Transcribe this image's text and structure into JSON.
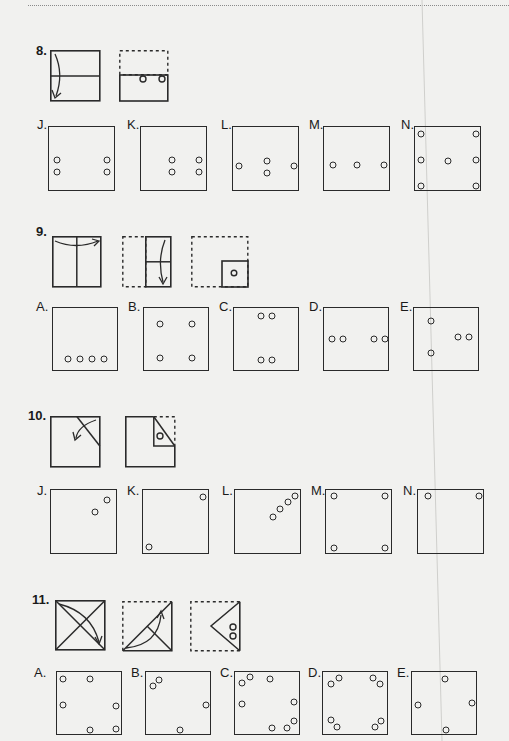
{
  "page": {
    "background": "#f1f1ef",
    "ink": "#2a2a2a"
  },
  "problems": [
    {
      "number": "8.",
      "steps": [
        "fold-top-down",
        "punch-two-holes"
      ],
      "options": [
        {
          "label": "J.",
          "holes": [
            [
              8,
              45
            ],
            [
              8,
              57
            ],
            [
              90,
              45
            ],
            [
              90,
              57
            ]
          ]
        },
        {
          "label": "K.",
          "holes": [
            [
              55,
              45
            ],
            [
              55,
              57
            ],
            [
              90,
              45
            ],
            [
              90,
              57
            ]
          ]
        },
        {
          "label": "L.",
          "holes": [
            [
              12,
              50
            ],
            [
              58,
              45
            ],
            [
              58,
              57
            ],
            [
              103,
              50
            ]
          ]
        },
        {
          "label": "M.",
          "holes": [
            [
              12,
              51
            ],
            [
              51,
              51
            ],
            [
              90,
              51
            ]
          ]
        },
        {
          "label": "N.",
          "holes": [
            [
              8,
              8
            ],
            [
              8,
              51
            ],
            [
              8,
              92
            ],
            [
              51,
              51
            ],
            [
              94,
              8
            ],
            [
              94,
              51
            ],
            [
              94,
              92
            ]
          ]
        }
      ]
    },
    {
      "number": "9.",
      "steps": [
        "fold-left-to-right",
        "fold-top-down",
        "punch-one-hole"
      ],
      "options": [
        {
          "label": "A.",
          "holes": [
            [
              15,
              50
            ],
            [
              27,
              50
            ],
            [
              39,
              50
            ],
            [
              51,
              50
            ]
          ]
        },
        {
          "label": "B.",
          "holes": [
            [
              15,
              15
            ],
            [
              49,
              15
            ],
            [
              15,
              48
            ],
            [
              49,
              48
            ]
          ]
        },
        {
          "label": "C.",
          "holes": [
            [
              28,
              8
            ],
            [
              39,
              8
            ],
            [
              28,
              51
            ],
            [
              39,
              51
            ]
          ]
        },
        {
          "label": "D.",
          "holes": [
            [
              9,
              30
            ],
            [
              20,
              30
            ],
            [
              51,
              30
            ],
            [
              62,
              30
            ]
          ]
        },
        {
          "label": "E.",
          "holes": [
            [
              18,
              12
            ],
            [
              43,
              28
            ],
            [
              54,
              28
            ],
            [
              18,
              44
            ]
          ]
        }
      ]
    },
    {
      "number": "10.",
      "steps": [
        "fold-corner-diagonal",
        "punch-one-hole"
      ],
      "options": [
        {
          "label": "J.",
          "holes": [
            [
              56,
              10
            ],
            [
              44,
              21
            ]
          ]
        },
        {
          "label": "K.",
          "holes": [
            [
              60,
              7
            ],
            [
              5,
              57
            ]
          ]
        },
        {
          "label": "L.",
          "holes": [
            [
              58,
              6
            ],
            [
              51,
              12
            ],
            [
              44,
              18
            ],
            [
              37,
              26
            ]
          ]
        },
        {
          "label": "M.",
          "holes": [
            [
              8,
              6
            ],
            [
              59,
              6
            ],
            [
              8,
              58
            ],
            [
              59,
              58
            ]
          ]
        },
        {
          "label": "N.",
          "holes": [
            [
              10,
              6
            ],
            [
              60,
              6
            ]
          ]
        }
      ]
    },
    {
      "number": "11.",
      "steps": [
        "fold-diagonal",
        "fold-diagonal-again",
        "punch-two-holes"
      ],
      "options": [
        {
          "label": "A.",
          "holes": [
            [
              5,
              6
            ],
            [
              32,
              6
            ],
            [
              5,
              32
            ],
            [
              59,
              33
            ],
            [
              32,
              58
            ],
            [
              59,
              57
            ]
          ]
        },
        {
          "label": "B.",
          "holes": [
            [
              7,
              13
            ],
            [
              13,
              7
            ],
            [
              60,
              32
            ],
            [
              33,
              58
            ]
          ]
        },
        {
          "label": "C.",
          "holes": [
            [
              7,
              10
            ],
            [
              15,
              5
            ],
            [
              35,
              7
            ],
            [
              7,
              31
            ],
            [
              59,
              29
            ],
            [
              59,
              48
            ],
            [
              52,
              55
            ],
            [
              37,
              55
            ]
          ]
        },
        {
          "label": "D.",
          "holes": [
            [
              8,
              11
            ],
            [
              16,
              5
            ],
            [
              50,
              5
            ],
            [
              57,
              11
            ],
            [
              8,
              48
            ],
            [
              14,
              55
            ],
            [
              52,
              55
            ],
            [
              58,
              49
            ]
          ]
        },
        {
          "label": "E.",
          "holes": [
            [
              32,
              6
            ],
            [
              5,
              33
            ],
            [
              60,
              31
            ],
            [
              34,
              58
            ]
          ]
        }
      ]
    }
  ]
}
